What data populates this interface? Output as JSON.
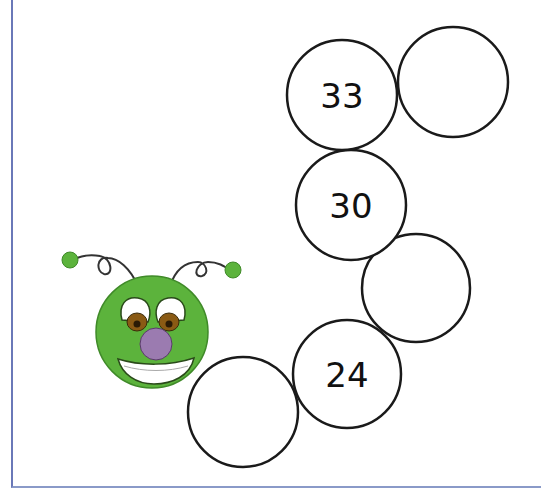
{
  "worksheet": {
    "top_text_fragment": "",
    "caterpillar": {
      "body_color": "#5cb33c",
      "nose_color": "#9b7bb0",
      "eye_iris_color": "#8a5a14"
    },
    "circles": [
      {
        "id": "c1",
        "label": "",
        "cx": 243,
        "cy": 412
      },
      {
        "id": "c2",
        "label": "24",
        "cx": 347,
        "cy": 374
      },
      {
        "id": "c3",
        "label": "",
        "cx": 416,
        "cy": 288
      },
      {
        "id": "c4",
        "label": "30",
        "cx": 351,
        "cy": 205
      },
      {
        "id": "c5",
        "label": "33",
        "cx": 342,
        "cy": 95
      },
      {
        "id": "c6",
        "label": "",
        "cx": 453,
        "cy": 82
      }
    ],
    "sequence": [
      "",
      "24",
      "",
      "30",
      "33",
      ""
    ]
  }
}
